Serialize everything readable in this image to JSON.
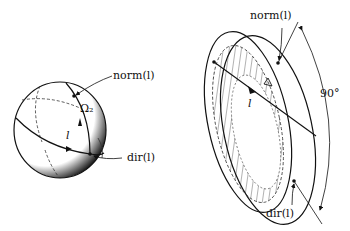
{
  "figure": {
    "left_panel": {
      "description": "sphere with great circles",
      "labels": {
        "norm": "norm(l)",
        "omega": "Ω₂",
        "line": "l",
        "dir": "dir(l)"
      }
    },
    "right_panel": {
      "description": "tilted disk pair with hatched region",
      "labels": {
        "norm": "norm(l)",
        "line": "l",
        "dir": "dir(l)",
        "angle": "90°"
      }
    },
    "colors": {
      "stroke": "#111111",
      "background": "#ffffff"
    }
  }
}
